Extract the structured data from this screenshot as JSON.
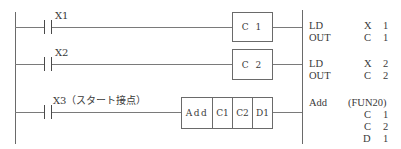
{
  "rungs": [
    {
      "contact_label": "X1",
      "output_box": "C 1",
      "instructions": [
        {
          "mnemonic": "LD",
          "operand": "X",
          "number": "1"
        },
        {
          "mnemonic": "OUT",
          "operand": "C",
          "number": "1"
        }
      ]
    },
    {
      "contact_label": "X2",
      "output_box": "C 2",
      "instructions": [
        {
          "mnemonic": "LD",
          "operand": "X",
          "number": "2"
        },
        {
          "mnemonic": "OUT",
          "operand": "C",
          "number": "2"
        }
      ]
    },
    {
      "contact_label": "X3（スタート接点）",
      "function_block": {
        "cells": [
          "Add",
          "C1",
          "C2",
          "D1"
        ]
      },
      "instructions": {
        "mnemonic": "Add",
        "function_code": "(FUN20)",
        "operands": [
          {
            "operand": "C",
            "number": "1"
          },
          {
            "operand": "C",
            "number": "2"
          },
          {
            "operand": "D",
            "number": "1"
          }
        ]
      }
    }
  ],
  "colors": {
    "line": "#6a6a6a",
    "text": "#3a3a3a",
    "background": "#ffffff"
  }
}
